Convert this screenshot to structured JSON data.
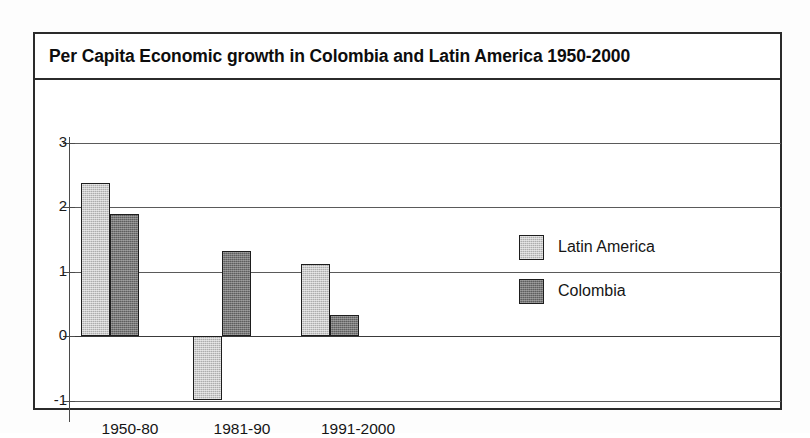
{
  "chart_data": {
    "type": "bar",
    "title": "Per Capita Economic growth in Colombia and Latin America 1950-2000",
    "xlabel": "",
    "ylabel": "",
    "categories": [
      "1950-80",
      "1981-90",
      "1991-2000"
    ],
    "series": [
      {
        "name": "Latin America",
        "color": "#adadad",
        "values": [
          2.38,
          -1.0,
          1.12
        ]
      },
      {
        "name": "Colombia",
        "color": "#5e5e5e",
        "values": [
          1.9,
          1.32,
          0.33
        ]
      }
    ],
    "ylim": [
      -1,
      3
    ],
    "yticks": [
      "3",
      "2",
      "1",
      "0",
      "-1"
    ],
    "ytick_values": [
      3,
      2,
      1,
      0,
      -1
    ],
    "grid": true,
    "legend_position": "center-right"
  },
  "legend": {
    "items": [
      {
        "label": "Latin America",
        "swatch": "latin-america-swatch"
      },
      {
        "label": "Colombia",
        "swatch": "colombia-swatch"
      }
    ]
  }
}
